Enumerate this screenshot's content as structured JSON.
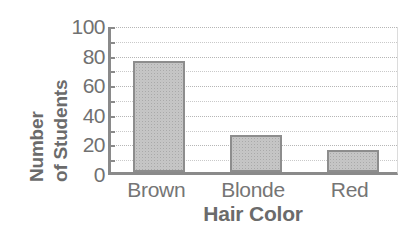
{
  "chart_data": {
    "type": "bar",
    "title": "",
    "xlabel": "Hair Color",
    "ylabel_lines": [
      "Number",
      "of Students"
    ],
    "ylabel": "Number of Students",
    "categories": [
      "Brown",
      "Blonde",
      "Red"
    ],
    "values": [
      75,
      25,
      15
    ],
    "ylim": [
      0,
      100
    ],
    "ytick_labels": [
      "100",
      "80",
      "60",
      "40",
      "20",
      "0"
    ],
    "ytick_values": [
      100,
      80,
      60,
      40,
      20,
      0
    ],
    "grid": true,
    "gridline_interval": 10,
    "gridline_values": [
      10,
      20,
      30,
      40,
      50,
      60,
      70,
      80,
      90,
      100
    ],
    "legend": "none",
    "colors": {
      "bar_fill": "#c6c6c6",
      "bar_edge": "#8d8d8d",
      "axis": "#8a8a8a",
      "grid": "#c9c9c9",
      "text": "#6e6e6e",
      "background": "#ffffff"
    }
  }
}
